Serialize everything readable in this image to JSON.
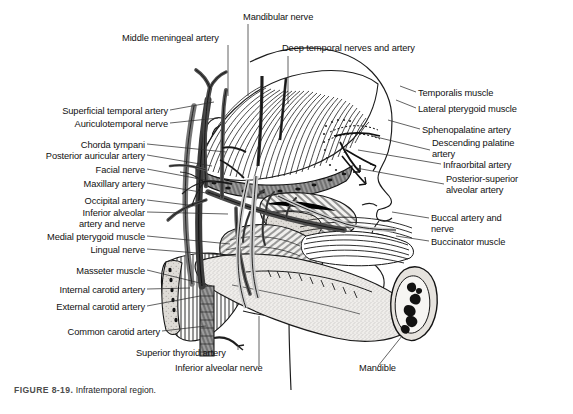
{
  "figure": {
    "number": "FIGURE 8-19.",
    "title": "Infratemporal region.",
    "caption_full": "FIGURE 8-19. Infratemporal region."
  },
  "colors": {
    "background": "#ffffff",
    "ink": "#111111",
    "leader": "#333333",
    "caption": "#555555",
    "bone_fill": "#e8e6e2",
    "muscle_fill": "#c9c7c2",
    "vessel_fill": "#6f6f6f",
    "marrow": "#111111"
  },
  "labels": {
    "top": [
      {
        "id": "mandibular-nerve",
        "text": "Mandibular nerve",
        "x": 243,
        "y": 18,
        "align": "left"
      },
      {
        "id": "middle-meningeal-artery",
        "text": "Middle meningeal artery",
        "x": 122,
        "y": 39,
        "align": "left"
      },
      {
        "id": "deep-temporal-nerves-and-artery",
        "text": "Deep temporal nerves and artery",
        "x": 282,
        "y": 49,
        "align": "left"
      }
    ],
    "left": [
      {
        "id": "superficial-temporal-artery",
        "text": "Superficial temporal artery",
        "x": 168,
        "y": 112,
        "align": "right"
      },
      {
        "id": "auriculotemporal-nerve",
        "text": "Auriculotemporal nerve",
        "x": 168,
        "y": 125,
        "align": "right"
      },
      {
        "id": "chorda-tympani",
        "text": "Chorda tympani",
        "x": 145,
        "y": 146,
        "align": "right"
      },
      {
        "id": "posterior-auricular-artery",
        "text": "Posterior auricular artery",
        "x": 145,
        "y": 157,
        "align": "right"
      },
      {
        "id": "facial-nerve",
        "text": "Facial nerve",
        "x": 145,
        "y": 171,
        "align": "right"
      },
      {
        "id": "maxillary-artery",
        "text": "Maxillary artery",
        "x": 145,
        "y": 185,
        "align": "right"
      },
      {
        "id": "occipital-artery",
        "text": "Occipital artery",
        "x": 145,
        "y": 202,
        "align": "right"
      },
      {
        "id": "inferior-alveolar-artery-and-nerve",
        "text": "Inferior alveolar\nartery and nerve",
        "x": 145,
        "y": 214,
        "align": "right"
      },
      {
        "id": "medial-pterygoid-muscle",
        "text": "Medial pterygoid muscle",
        "x": 145,
        "y": 238,
        "align": "right"
      },
      {
        "id": "lingual-nerve",
        "text": "Lingual nerve",
        "x": 145,
        "y": 251,
        "align": "right"
      },
      {
        "id": "masseter-muscle",
        "text": "Masseter muscle",
        "x": 145,
        "y": 272,
        "align": "right"
      },
      {
        "id": "internal-carotid-artery",
        "text": "Internal carotid artery",
        "x": 145,
        "y": 291,
        "align": "right"
      },
      {
        "id": "external-carotid-artery",
        "text": "External carotid artery",
        "x": 145,
        "y": 308,
        "align": "right"
      },
      {
        "id": "common-carotid-artery",
        "text": "Common carotid artery",
        "x": 160,
        "y": 333,
        "align": "right"
      }
    ],
    "bottom": [
      {
        "id": "superior-thyroid-artery",
        "text": "Superior thyroid artery",
        "x": 136,
        "y": 354,
        "align": "left"
      },
      {
        "id": "inferior-alveolar-nerve",
        "text": "Inferior alveolar nerve",
        "x": 175,
        "y": 369,
        "align": "left"
      },
      {
        "id": "mandible",
        "text": "Mandible",
        "x": 359,
        "y": 369,
        "align": "left"
      }
    ],
    "right": [
      {
        "id": "temporalis-muscle",
        "text": "Temporalis muscle",
        "x": 418,
        "y": 94,
        "align": "left"
      },
      {
        "id": "lateral-pterygoid-muscle",
        "text": "Lateral pterygoid muscle",
        "x": 418,
        "y": 110,
        "align": "left"
      },
      {
        "id": "sphenopalatine-artery",
        "text": "Sphenopalatine artery",
        "x": 422,
        "y": 131,
        "align": "left"
      },
      {
        "id": "descending-palatine-artery",
        "text": "Descending palatine\nartery",
        "x": 432,
        "y": 144,
        "align": "left"
      },
      {
        "id": "infraorbital-artery",
        "text": "Infraorbital artery",
        "x": 443,
        "y": 166,
        "align": "left"
      },
      {
        "id": "posterior-superior-alveolar-artery",
        "text": "Posterior-superior\nalveolar artery",
        "x": 446,
        "y": 180,
        "align": "left"
      },
      {
        "id": "buccal-artery-and-nerve",
        "text": "Buccal artery and\nnerve",
        "x": 431,
        "y": 219,
        "align": "left"
      },
      {
        "id": "buccinator-muscle",
        "text": "Buccinator muscle",
        "x": 431,
        "y": 243,
        "align": "left"
      }
    ]
  },
  "structures": [
    "temporalis muscle",
    "lateral pterygoid muscle",
    "medial pterygoid muscle",
    "masseter muscle",
    "buccinator muscle",
    "mandible",
    "maxillary artery",
    "superficial temporal artery",
    "middle meningeal artery",
    "inferior alveolar artery and nerve",
    "lingual nerve",
    "chorda tympani",
    "facial nerve",
    "auriculotemporal nerve",
    "occipital artery",
    "posterior auricular artery",
    "internal carotid artery",
    "external carotid artery",
    "common carotid artery",
    "superior thyroid artery",
    "sphenopalatine artery",
    "descending palatine artery",
    "infraorbital artery",
    "posterior-superior alveolar artery",
    "buccal artery and nerve",
    "mandibular nerve",
    "deep temporal nerves and artery"
  ]
}
